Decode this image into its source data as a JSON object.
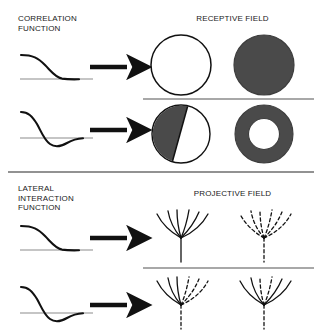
{
  "figure": {
    "width": 322,
    "height": 335,
    "background": "#ffffff",
    "ink": "#1a1a1a",
    "fill_gray": "#4a4a4a",
    "rule_gray": "#808080"
  },
  "sections": [
    {
      "id": "receptive",
      "left_label": "CORRELATION\nFUNCTION",
      "right_label": "RECEPTIVE FIELD",
      "rows": [
        {
          "id": "receptive-row-1",
          "curve": "monophasic-decay",
          "curve_name": "positive-correlation-curve",
          "arrow": "right-arrow",
          "outputs": [
            {
              "name": "unfilled-disc",
              "shape": "circle",
              "fill": "none"
            },
            {
              "name": "filled-disc",
              "shape": "circle",
              "fill": "gray"
            }
          ]
        },
        {
          "id": "receptive-row-2",
          "curve": "biphasic-mexican-hat",
          "curve_name": "center-surround-correlation-curve",
          "arrow": "right-arrow",
          "outputs": [
            {
              "name": "split-disc",
              "shape": "half-circle",
              "fill": "gray-left"
            },
            {
              "name": "annulus-disc",
              "shape": "annulus",
              "fill": "gray-ring"
            }
          ]
        }
      ]
    },
    {
      "id": "projective",
      "left_label": "LATERAL\nINTERACTION\nFUNCTION",
      "right_label": "PROJECTIVE FIELD",
      "rows": [
        {
          "id": "projective-row-1",
          "curve": "monophasic-decay",
          "curve_name": "positive-lateral-curve",
          "arrow": "right-arrow",
          "outputs": [
            {
              "name": "solid-fan",
              "shape": "fan",
              "style": "all-solid"
            },
            {
              "name": "dashed-fan",
              "shape": "fan",
              "style": "all-dashed"
            }
          ]
        },
        {
          "id": "projective-row-2",
          "curve": "biphasic-mexican-hat",
          "curve_name": "center-surround-lateral-curve",
          "arrow": "right-arrow",
          "outputs": [
            {
              "name": "half-solid-half-dashed-fan",
              "shape": "fan",
              "style": "left-solid-right-dashed"
            },
            {
              "name": "solid-outer-dashed-inner-fan",
              "shape": "fan",
              "style": "outer-solid-inner-dashed"
            }
          ]
        }
      ]
    }
  ],
  "dividers": [
    {
      "name": "receptive-row-divider",
      "orientation": "horizontal"
    },
    {
      "name": "section-divider",
      "orientation": "horizontal"
    },
    {
      "name": "projective-row-divider",
      "orientation": "horizontal"
    }
  ]
}
